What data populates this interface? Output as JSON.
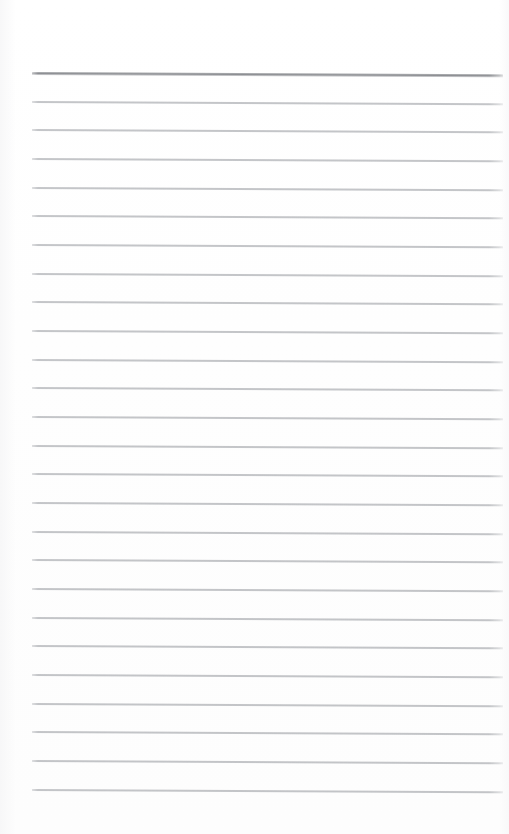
{
  "document": {
    "kind": "lined-paper-scan",
    "title": "Blank ruled notepad page",
    "page_width": 509,
    "page_height": 834,
    "background_color": "#ffffff",
    "written_content": "",
    "visible_text": []
  },
  "ruling": {
    "line_count": 26,
    "first_line_y": 72,
    "line_spacing": 28.64,
    "left_x": 32,
    "right_x": 503,
    "line_length": 471,
    "slant_degrees": 0.28,
    "header_rule": {
      "index": 0,
      "color": "#7a7c81",
      "thickness": 3,
      "label": "header-rule"
    },
    "body_rule": {
      "color": "#9d9fa4",
      "thickness": 1.6,
      "label": "body-rule"
    },
    "margins": {
      "top": 72,
      "bottom": 46,
      "left": 32,
      "right": 6
    }
  },
  "lines": [
    {
      "index": 0,
      "y": 72,
      "type": "header"
    },
    {
      "index": 1,
      "y": 101,
      "type": "body"
    },
    {
      "index": 2,
      "y": 129,
      "type": "body"
    },
    {
      "index": 3,
      "y": 158,
      "type": "body"
    },
    {
      "index": 4,
      "y": 187,
      "type": "body"
    },
    {
      "index": 5,
      "y": 215,
      "type": "body"
    },
    {
      "index": 6,
      "y": 244,
      "type": "body"
    },
    {
      "index": 7,
      "y": 273,
      "type": "body"
    },
    {
      "index": 8,
      "y": 301,
      "type": "body"
    },
    {
      "index": 9,
      "y": 330,
      "type": "body"
    },
    {
      "index": 10,
      "y": 359,
      "type": "body"
    },
    {
      "index": 11,
      "y": 387,
      "type": "body"
    },
    {
      "index": 12,
      "y": 416,
      "type": "body"
    },
    {
      "index": 13,
      "y": 445,
      "type": "body"
    },
    {
      "index": 14,
      "y": 473,
      "type": "body"
    },
    {
      "index": 15,
      "y": 502,
      "type": "body"
    },
    {
      "index": 16,
      "y": 531,
      "type": "body"
    },
    {
      "index": 17,
      "y": 559,
      "type": "body"
    },
    {
      "index": 18,
      "y": 588,
      "type": "body"
    },
    {
      "index": 19,
      "y": 617,
      "type": "body"
    },
    {
      "index": 20,
      "y": 645,
      "type": "body"
    },
    {
      "index": 21,
      "y": 674,
      "type": "body"
    },
    {
      "index": 22,
      "y": 703,
      "type": "body"
    },
    {
      "index": 23,
      "y": 731,
      "type": "body"
    },
    {
      "index": 24,
      "y": 760,
      "type": "body"
    },
    {
      "index": 25,
      "y": 789,
      "type": "body"
    }
  ]
}
